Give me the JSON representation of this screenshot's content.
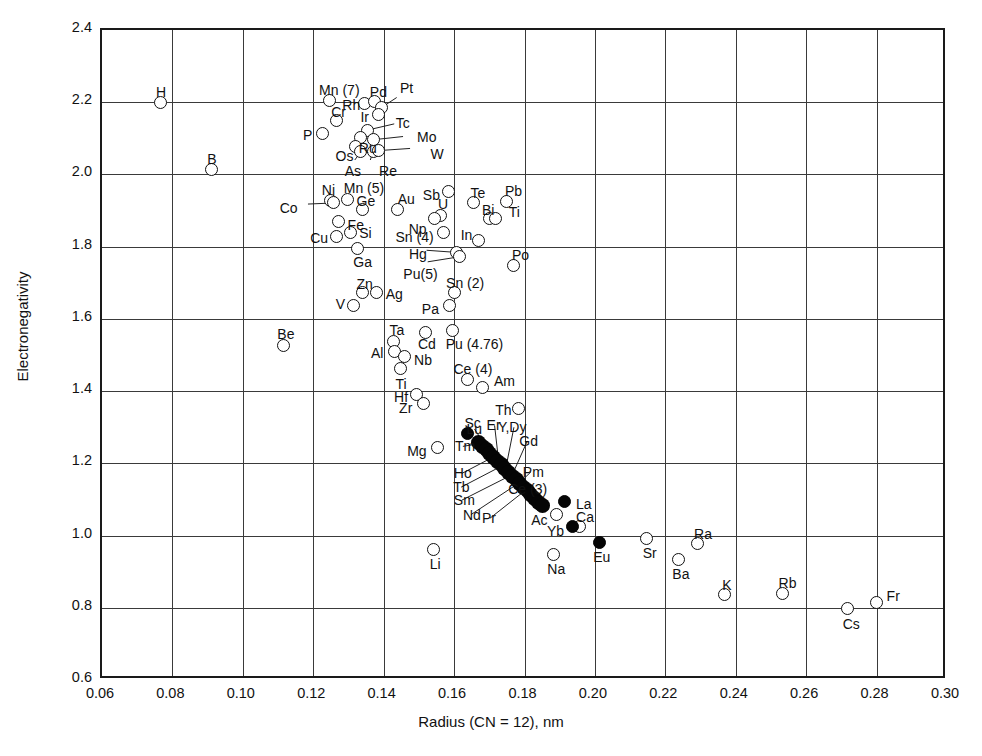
{
  "chart_data": {
    "type": "scatter",
    "title": "",
    "xlabel": "Radius (CN = 12), nm",
    "ylabel": "Electronegativity",
    "xlim": [
      0.06,
      0.3
    ],
    "ylim": [
      0.6,
      2.4
    ],
    "xticks": [
      "0.06",
      "0.08",
      "0.10",
      "0.12",
      "0.14",
      "0.16",
      "0.18",
      "0.20",
      "0.22",
      "0.24",
      "0.26",
      "0.28",
      "0.30"
    ],
    "yticks": [
      "2.4",
      "2.2",
      "2.0",
      "1.8",
      "1.6",
      "1.4",
      "1.2",
      "1.0",
      "0.8",
      "0.6"
    ],
    "grid": true,
    "legend": "none",
    "marker_styles": {
      "open": "open circle (most elements)",
      "filled": "filled circle (lanthanides / rare earths)"
    },
    "series": [
      {
        "name": "Elements (open circles)",
        "marker": "open",
        "points": [
          {
            "label": "H",
            "x": 0.0765,
            "y": 2.2,
            "lx": -4,
            "ly": -17
          },
          {
            "label": "B",
            "x": 0.091,
            "y": 2.015,
            "lx": -4,
            "ly": -17
          },
          {
            "label": "Mn (7)",
            "x": 0.1245,
            "y": 2.205,
            "lx": -10,
            "ly": -17
          },
          {
            "label": "Rh",
            "x": 0.1345,
            "y": 2.197,
            "lx": -22,
            "ly": -5
          },
          {
            "label": "Pd",
            "x": 0.1375,
            "y": 2.202,
            "lx": -5,
            "ly": -17
          },
          {
            "label": "Pt",
            "x": 0.1395,
            "y": 2.186,
            "lx": 18,
            "ly": -26
          },
          {
            "label": "Cr",
            "x": 0.1265,
            "y": 2.149,
            "lx": -5,
            "ly": -16
          },
          {
            "label": "Ir",
            "x": 0.1385,
            "y": 2.165,
            "lx": -18,
            "ly": -5
          },
          {
            "label": "P",
            "x": 0.1225,
            "y": 2.113,
            "lx": -19,
            "ly": -6
          },
          {
            "label": "Tc",
            "x": 0.1355,
            "y": 2.123,
            "lx": 28,
            "ly": -14
          },
          {
            "label": "Ru",
            "x": 0.1335,
            "y": 2.103,
            "lx": -2,
            "ly": 4
          },
          {
            "label": "Mo",
            "x": 0.137,
            "y": 2.096,
            "lx": 44,
            "ly": -10
          },
          {
            "label": "Os",
            "x": 0.132,
            "y": 2.078,
            "lx": -20,
            "ly": 3
          },
          {
            "label": "As",
            "x": 0.1335,
            "y": 2.063,
            "lx": -16,
            "ly": 12
          },
          {
            "label": "Re",
            "x": 0.137,
            "y": 2.063,
            "lx": 6,
            "ly": 12
          },
          {
            "label": "W",
            "x": 0.1385,
            "y": 2.066,
            "lx": 52,
            "ly": -4
          },
          {
            "label": "Ni",
            "x": 0.125,
            "y": 1.928,
            "lx": -9,
            "ly": -17
          },
          {
            "label": "Co",
            "x": 0.1258,
            "y": 1.921,
            "lx": -54,
            "ly": -2
          },
          {
            "label": "Mn (5)",
            "x": 0.1298,
            "y": 1.931,
            "lx": -4,
            "ly": -18
          },
          {
            "label": "Ge",
            "x": 0.134,
            "y": 1.902,
            "lx": -6,
            "ly": -16
          },
          {
            "label": "Au",
            "x": 0.144,
            "y": 1.903,
            "lx": 0,
            "ly": -17
          },
          {
            "label": "Sb",
            "x": 0.1585,
            "y": 1.952,
            "lx": -26,
            "ly": -4
          },
          {
            "label": "U",
            "x": 0.156,
            "y": 1.887,
            "lx": -2,
            "ly": -18
          },
          {
            "label": "Te",
            "x": 0.1655,
            "y": 1.921,
            "lx": -3,
            "ly": -17
          },
          {
            "label": "Pb",
            "x": 0.175,
            "y": 1.926,
            "lx": -2,
            "ly": -17
          },
          {
            "label": "Fe",
            "x": 0.1272,
            "y": 1.87,
            "lx": 9,
            "ly": -3
          },
          {
            "label": "Np",
            "x": 0.1545,
            "y": 1.877,
            "lx": -26,
            "ly": 3
          },
          {
            "label": "Bi",
            "x": 0.1702,
            "y": 1.877,
            "lx": -8,
            "ly": -16
          },
          {
            "label": "Ti",
            "x": 0.1718,
            "y": 1.877,
            "lx": 13,
            "ly": -14
          },
          {
            "label": "Cu",
            "x": 0.1265,
            "y": 1.829,
            "lx": -26,
            "ly": -5
          },
          {
            "label": "Si",
            "x": 0.1305,
            "y": 1.84,
            "lx": 9,
            "ly": -6
          },
          {
            "label": "Sn (4)",
            "x": 0.157,
            "y": 1.838,
            "lx": -48,
            "ly": -3
          },
          {
            "label": "In",
            "x": 0.167,
            "y": 1.818,
            "lx": -18,
            "ly": -12
          },
          {
            "label": "Ga",
            "x": 0.1325,
            "y": 1.795,
            "lx": -4,
            "ly": 7
          },
          {
            "label": "Hg",
            "x": 0.1608,
            "y": 1.784,
            "lx": -48,
            "ly": -5
          },
          {
            "label": "Pu(5)",
            "x": 0.1615,
            "y": 1.772,
            "lx": -56,
            "ly": 10
          },
          {
            "label": "Po",
            "x": 0.177,
            "y": 1.748,
            "lx": -2,
            "ly": -17
          },
          {
            "label": "Zn",
            "x": 0.134,
            "y": 1.673,
            "lx": -6,
            "ly": -16
          },
          {
            "label": "V",
            "x": 0.1315,
            "y": 1.637,
            "lx": -18,
            "ly": -9
          },
          {
            "label": "Ag",
            "x": 0.138,
            "y": 1.674,
            "lx": 9,
            "ly": -5
          },
          {
            "label": "Sn (2)",
            "x": 0.16,
            "y": 1.672,
            "lx": -8,
            "ly": -17
          },
          {
            "label": "Pa",
            "x": 0.1588,
            "y": 1.637,
            "lx": -28,
            "ly": -4
          },
          {
            "label": "Be",
            "x": 0.1115,
            "y": 1.525,
            "lx": -6,
            "ly": -19
          },
          {
            "label": "Ta",
            "x": 0.1428,
            "y": 1.538,
            "lx": -4,
            "ly": -18
          },
          {
            "label": "Cd",
            "x": 0.152,
            "y": 1.563,
            "lx": -8,
            "ly": 5
          },
          {
            "label": "Pu (4.76)",
            "x": 0.1596,
            "y": 1.567,
            "lx": -7,
            "ly": 6
          },
          {
            "label": "Al",
            "x": 0.1432,
            "y": 1.51,
            "lx": -24,
            "ly": -5
          },
          {
            "label": "Nb",
            "x": 0.1458,
            "y": 1.497,
            "lx": 10,
            "ly": -3
          },
          {
            "label": "Ti",
            "x": 0.1448,
            "y": 1.462,
            "lx": -5,
            "ly": 8
          },
          {
            "label": "Ce (4)",
            "x": 0.1638,
            "y": 1.432,
            "lx": -14,
            "ly": -18
          },
          {
            "label": "Am",
            "x": 0.1682,
            "y": 1.41,
            "lx": 11,
            "ly": -14
          },
          {
            "label": "Hf",
            "x": 0.1492,
            "y": 1.39,
            "lx": -22,
            "ly": -5
          },
          {
            "label": "Zr",
            "x": 0.1512,
            "y": 1.367,
            "lx": -24,
            "ly": -2
          },
          {
            "label": "Th",
            "x": 0.1782,
            "y": 1.353,
            "lx": -23,
            "ly": -5
          },
          {
            "label": "Mg",
            "x": 0.1552,
            "y": 1.243,
            "lx": -30,
            "ly": -4
          },
          {
            "label": "Ac",
            "x": 0.189,
            "y": 1.058,
            "lx": -25,
            "ly": -2
          },
          {
            "label": "Ca",
            "x": 0.1955,
            "y": 1.025,
            "lx": -3,
            "ly": -17
          },
          {
            "label": "Li",
            "x": 0.1542,
            "y": 0.962,
            "lx": -4,
            "ly": 8
          },
          {
            "label": "Na",
            "x": 0.1882,
            "y": 0.948,
            "lx": -6,
            "ly": 8
          },
          {
            "label": "Sr",
            "x": 0.2147,
            "y": 0.992,
            "lx": -4,
            "ly": 8
          },
          {
            "label": "Ra",
            "x": 0.229,
            "y": 0.978,
            "lx": -3,
            "ly": -17
          },
          {
            "label": "Ba",
            "x": 0.2237,
            "y": 0.935,
            "lx": -6,
            "ly": 8
          },
          {
            "label": "K",
            "x": 0.2367,
            "y": 0.836,
            "lx": -2,
            "ly": -17
          },
          {
            "label": "Rb",
            "x": 0.2533,
            "y": 0.84,
            "lx": -4,
            "ly": -17
          },
          {
            "label": "Cs",
            "x": 0.2718,
            "y": 0.797,
            "lx": -5,
            "ly": 8
          },
          {
            "label": "Fr",
            "x": 0.28,
            "y": 0.815,
            "lx": 10,
            "ly": -13
          }
        ]
      },
      {
        "name": "Lanthanides / rare earths (filled circles)",
        "marker": "filled",
        "points": [
          {
            "label": "Sc",
            "x": 0.1638,
            "y": 1.282,
            "lx": -3,
            "ly": -18
          },
          {
            "label": "La",
            "x": 0.1915,
            "y": 1.094,
            "lx": 11,
            "ly": -5
          },
          {
            "label": "Yb",
            "x": 0.1935,
            "y": 1.025,
            "lx": -25,
            "ly": -3
          },
          {
            "label": "Eu",
            "x": 0.2012,
            "y": 0.982,
            "lx": -6,
            "ly": 8
          }
        ]
      },
      {
        "name": "Lanthanide chain (dense filled circles)",
        "marker": "chain",
        "chain_from": {
          "x": 0.167,
          "y": 1.258
        },
        "chain_to": {
          "x": 0.185,
          "y": 1.082
        },
        "count": 18,
        "labels": [
          {
            "label": "Tm",
            "tx": 0.1625,
            "ty": 1.247,
            "ax": 0.1674,
            "ay": 1.255
          },
          {
            "label": "Lu",
            "tx": 0.1658,
            "ty": 1.295,
            "ax": 0.17,
            "ay": 1.232
          },
          {
            "label": "Er",
            "tx": 0.1715,
            "ty": 1.305,
            "ax": 0.1726,
            "ay": 1.211
          },
          {
            "label": "Y,Dy",
            "tx": 0.177,
            "ty": 1.3,
            "ax": 0.1748,
            "ay": 1.192
          },
          {
            "label": "Gd",
            "tx": 0.1808,
            "ty": 1.262,
            "ax": 0.1768,
            "ay": 1.174
          },
          {
            "label": "Pm",
            "tx": 0.1818,
            "ty": 1.176,
            "ax": 0.179,
            "ay": 1.15
          },
          {
            "label": "Ce (3)",
            "tx": 0.1822,
            "ty": 1.13,
            "ax": 0.1808,
            "ay": 1.124
          },
          {
            "label": "Ho",
            "tx": 0.1622,
            "ty": 1.172,
            "ax": 0.1716,
            "ay": 1.22
          },
          {
            "label": "Tb",
            "tx": 0.162,
            "ty": 1.134,
            "ax": 0.1742,
            "ay": 1.196
          },
          {
            "label": "Sm",
            "tx": 0.1622,
            "ty": 1.098,
            "ax": 0.1768,
            "ay": 1.17
          },
          {
            "label": "Nd",
            "tx": 0.1648,
            "ty": 1.058,
            "ax": 0.1788,
            "ay": 1.148
          },
          {
            "label": "Pr",
            "tx": 0.1702,
            "ty": 1.048,
            "ax": 0.1806,
            "ay": 1.128
          }
        ]
      }
    ]
  }
}
